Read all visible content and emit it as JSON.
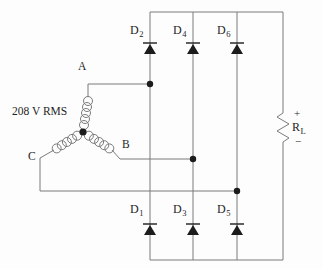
{
  "source": {
    "voltage_label": "208 V RMS",
    "phases": [
      "A",
      "B",
      "C"
    ]
  },
  "diodes": {
    "top": [
      {
        "base": "D",
        "sub": "2"
      },
      {
        "base": "D",
        "sub": "4"
      },
      {
        "base": "D",
        "sub": "6"
      }
    ],
    "bottom": [
      {
        "base": "D",
        "sub": "1"
      },
      {
        "base": "D",
        "sub": "3"
      },
      {
        "base": "D",
        "sub": "5"
      }
    ]
  },
  "load": {
    "plus": "+",
    "base": "R",
    "sub": "L",
    "minus": "−"
  },
  "colors": {
    "wire": "#7b7b7b",
    "component": "#1c1c1c",
    "text": "#1f1f1f",
    "background": "#fdfdfd"
  }
}
